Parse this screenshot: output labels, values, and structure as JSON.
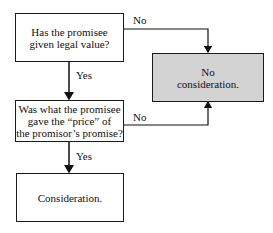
{
  "diagram": {
    "type": "flowchart",
    "nodes": [
      {
        "id": "q1",
        "text": "Has the promisee given legal value?",
        "lines": [
          "Has the promisee",
          "given legal value?"
        ]
      },
      {
        "id": "q2",
        "text": "Was what the promisee gave the “price” of the promisor’s promise?",
        "lines": [
          "Was what the promisee",
          "gave the “price” of",
          "the promisor’s promise?"
        ]
      },
      {
        "id": "yes_result",
        "text": "Consideration."
      },
      {
        "id": "no_result",
        "text": "No consideration.",
        "lines": [
          "No",
          "consideration."
        ],
        "fill": "#d3d3d3"
      }
    ],
    "edges": [
      {
        "from": "q1",
        "to": "q2",
        "label": "Yes"
      },
      {
        "from": "q1",
        "to": "no_result",
        "label": "No"
      },
      {
        "from": "q2",
        "to": "yes_result",
        "label": "Yes"
      },
      {
        "from": "q2",
        "to": "no_result",
        "label": "No"
      }
    ]
  }
}
